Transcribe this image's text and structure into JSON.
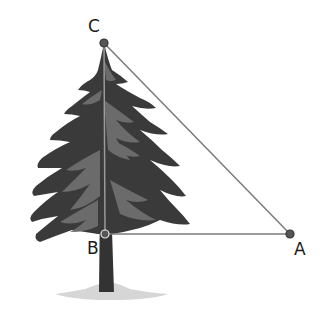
{
  "diagram": {
    "type": "right-triangle-tree-height",
    "colors": {
      "background": "#ffffff",
      "tree_dark": "#3a3a3a",
      "tree_mid": "#6b6b6b",
      "trunk": "#333333",
      "shadow": "#d6d6d6",
      "line": "#7a7a7a",
      "point_fill": "#555555",
      "point_stroke": "#333333",
      "label": "#1a1a1a"
    },
    "points": {
      "C": {
        "label": "C",
        "x": 104,
        "y": 43
      },
      "B": {
        "label": "B",
        "x": 105,
        "y": 234
      },
      "A": {
        "label": "A",
        "x": 290,
        "y": 234
      }
    },
    "segments": [
      {
        "from": "C",
        "to": "A"
      },
      {
        "from": "B",
        "to": "A"
      },
      {
        "from": "C",
        "to": "B"
      }
    ],
    "objects": [
      {
        "name": "pine-tree",
        "description": "Evergreen tree whose height is segment CB"
      }
    ]
  }
}
